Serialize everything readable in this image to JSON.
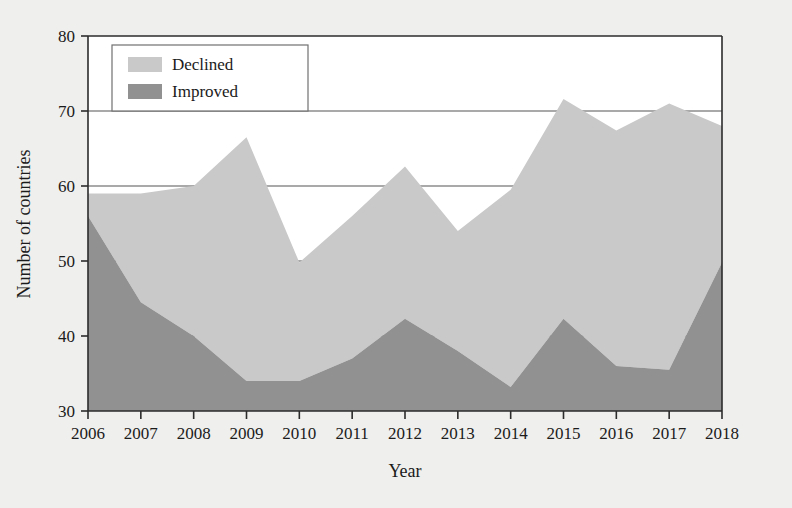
{
  "chart_data": {
    "type": "area",
    "stacked": true,
    "title": "",
    "xlabel": "Year",
    "ylabel": "Number of countries",
    "categories": [
      2006,
      2007,
      2008,
      2009,
      2010,
      2011,
      2012,
      2013,
      2014,
      2015,
      2016,
      2017,
      2018
    ],
    "x_tick_labels": [
      "2006",
      "2007",
      "2008",
      "2009",
      "2010",
      "2011",
      "2012",
      "2013",
      "2014",
      "2015",
      "2016",
      "2017",
      "2018"
    ],
    "y_tick_labels": [
      "30",
      "40",
      "50",
      "60",
      "70",
      "80"
    ],
    "y_ticks": [
      30,
      40,
      50,
      60,
      70,
      80
    ],
    "xlim": [
      2006,
      2018
    ],
    "ylim": [
      30,
      80
    ],
    "grid": true,
    "grid_axis": "y",
    "legend_position": "top-left",
    "series": [
      {
        "name": "Declined",
        "color": "#c9c9c9",
        "values": [
          59,
          59,
          60,
          66.5,
          49.8,
          56,
          62.6,
          54,
          59.5,
          71.6,
          67.4,
          71,
          68
        ]
      },
      {
        "name": "Improved",
        "color": "#919191",
        "values": [
          56,
          44.5,
          40,
          34,
          34,
          37,
          42.3,
          38,
          33.2,
          42.3,
          36,
          35.5,
          49.8
        ]
      }
    ],
    "series_note": "Declined values are the cumulative top edge of the stacked area; Improved values are the upper edge of the dark lower band."
  },
  "legend": {
    "items": [
      {
        "label": "Declined",
        "color": "#c9c9c9"
      },
      {
        "label": "Improved",
        "color": "#919191"
      }
    ]
  },
  "axes": {
    "y_title": "Number of countries",
    "x_title": "Year"
  },
  "colors": {
    "background": "#efefed",
    "plot_background": "#ffffff",
    "axis": "#2b2b2b",
    "grid": "#555555",
    "declined": "#c9c9c9",
    "improved": "#919191",
    "text": "#1b1b1b"
  }
}
